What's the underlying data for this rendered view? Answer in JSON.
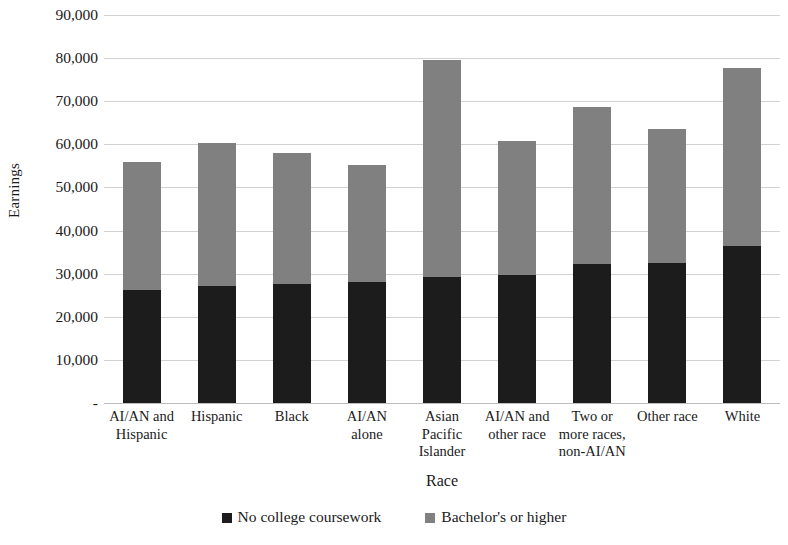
{
  "chart_data": {
    "type": "bar",
    "subtype": "stacked-bar",
    "title": "",
    "xlabel": "Race",
    "ylabel": "Earnings",
    "ylim": [
      0,
      90000
    ],
    "ytick_interval": 10000,
    "ytick_labels": [
      "90,000",
      "80,000",
      "70,000",
      "60,000",
      "50,000",
      "40,000",
      "30,000",
      "20,000",
      "10,000",
      "-"
    ],
    "ytick_values": [
      90000,
      80000,
      70000,
      60000,
      50000,
      40000,
      30000,
      20000,
      10000,
      0
    ],
    "grid": true,
    "legend_position": "bottom",
    "categories": [
      "AI/AN and Hispanic",
      "Hispanic",
      "Black",
      "AI/AN alone",
      "Asian Pacific Islander",
      "AI/AN and other race",
      "Two or more races, non-AI/AN",
      "Other race",
      "White"
    ],
    "category_label_lines": [
      [
        "AI/AN and",
        "Hispanic"
      ],
      [
        "Hispanic"
      ],
      [
        "Black"
      ],
      [
        "AI/AN",
        "alone"
      ],
      [
        "Asian",
        "Pacific",
        "Islander"
      ],
      [
        "AI/AN and",
        "other race"
      ],
      [
        "Two or",
        "more races,",
        "non-AI/AN"
      ],
      [
        "Other race"
      ],
      [
        "White"
      ]
    ],
    "series": [
      {
        "name": "No college coursework",
        "color": "#1c1c1c",
        "values": [
          26200,
          27200,
          27600,
          28100,
          29200,
          29600,
          32300,
          32400,
          36400
        ]
      },
      {
        "name": "Bachelor's or higher",
        "color": "#808080",
        "values": [
          29600,
          33100,
          30500,
          27100,
          50300,
          31100,
          36400,
          31200,
          41200
        ]
      }
    ],
    "totals": [
      55800,
      60300,
      58100,
      55200,
      79500,
      60700,
      68700,
      63600,
      77600
    ]
  },
  "legend": {
    "items": [
      {
        "label": "No college coursework",
        "color": "#1c1c1c"
      },
      {
        "label": "Bachelor's or higher",
        "color": "#808080"
      }
    ]
  }
}
